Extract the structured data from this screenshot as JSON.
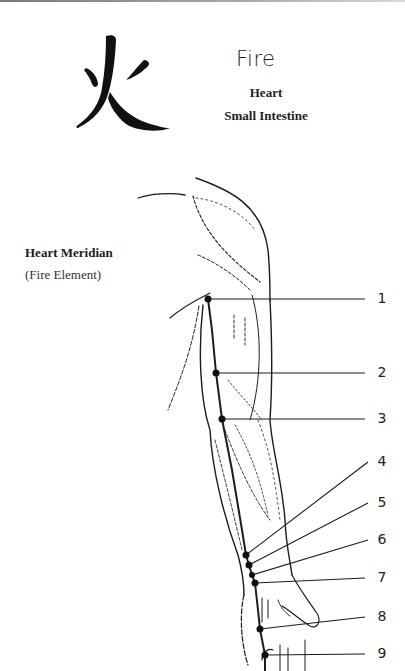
{
  "header": {
    "character": "火",
    "element": "Fire",
    "organs": [
      "Heart",
      "Small Intestine"
    ]
  },
  "meridian": {
    "title": "Heart Meridian",
    "subtitle": "(Fire Element)"
  },
  "points": [
    {
      "label": "1",
      "x": 208,
      "y": 299,
      "lx": 373,
      "ly": 299
    },
    {
      "label": "2",
      "x": 216,
      "y": 373,
      "lx": 373,
      "ly": 373
    },
    {
      "label": "3",
      "x": 222,
      "y": 419,
      "lx": 373,
      "ly": 419
    },
    {
      "label": "4",
      "x": 246,
      "y": 555,
      "lx": 373,
      "ly": 462
    },
    {
      "label": "5",
      "x": 249,
      "y": 565,
      "lx": 373,
      "ly": 503
    },
    {
      "label": "6",
      "x": 252,
      "y": 575,
      "lx": 373,
      "ly": 540
    },
    {
      "label": "7",
      "x": 255,
      "y": 583,
      "lx": 373,
      "ly": 578
    },
    {
      "label": "8",
      "x": 260,
      "y": 629,
      "lx": 373,
      "ly": 617
    },
    {
      "label": "9",
      "x": 265,
      "y": 655,
      "lx": 373,
      "ly": 654
    }
  ],
  "colors": {
    "ink": "#1c1c1c",
    "background": "#ffffff"
  }
}
